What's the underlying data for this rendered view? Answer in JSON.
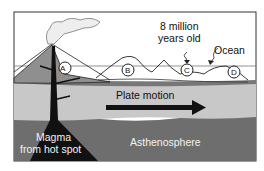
{
  "diagram": {
    "type": "hot spot volcanic island chain cross-section",
    "labels": {
      "age": "8 million\nyears old",
      "age_line1": "8 million",
      "age_line2": "years old",
      "ocean": "Ocean",
      "plate_motion": "Plate motion",
      "magma_line1": "Magma",
      "magma_line2": "from hot spot",
      "asthenosphere": "Asthenosphere"
    },
    "islands": [
      {
        "id": "A",
        "label": "A"
      },
      {
        "id": "B",
        "label": "B"
      },
      {
        "id": "C",
        "label": "C"
      },
      {
        "id": "D",
        "label": "D"
      }
    ],
    "colors": {
      "sky": "#ffffff",
      "volcano": "#8f8f8f",
      "lithosphere": "#c8c8c8",
      "asthenosphere": "#6e6e6e",
      "magma": "#111111",
      "outline": "#222222"
    }
  }
}
